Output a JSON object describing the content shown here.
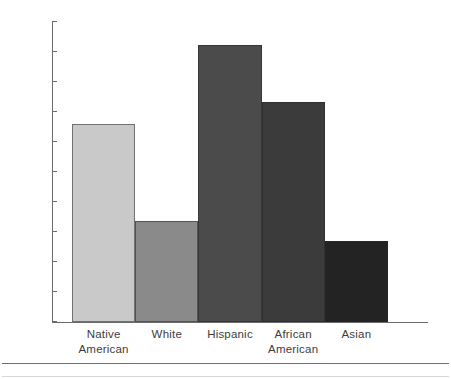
{
  "chart_data": {
    "type": "bar",
    "title": "",
    "subtitle": "",
    "xlabel": "",
    "ylabel": "",
    "categories": [
      "Native American",
      "White",
      "Hispanic",
      "African American",
      "Asian"
    ],
    "values": [
      33.0,
      16.8,
      46.2,
      36.7,
      13.5
    ],
    "ylim": [
      0,
      50
    ],
    "y_ticks": [
      0,
      5,
      10,
      15,
      20,
      25,
      30,
      35,
      40,
      45,
      50
    ],
    "y_tick_labels": [
      "0",
      "5",
      "10",
      "15",
      "20",
      "25",
      "30",
      "35",
      "40",
      "45",
      "50"
    ],
    "grid": false,
    "legend": false,
    "legend_position": "none",
    "annotations": [],
    "bar_colors": [
      "#c9c9c9",
      "#8a8a8a",
      "#4b4b4b",
      "#3b3b3b",
      "#232323"
    ],
    "bars": [
      {
        "category": "Native American",
        "label_lines": [
          "Native",
          "American"
        ],
        "value": 33.0,
        "color": "#c9c9c9"
      },
      {
        "category": "White",
        "label_lines": [
          "White"
        ],
        "value": 16.8,
        "color": "#8a8a8a"
      },
      {
        "category": "Hispanic",
        "label_lines": [
          "Hispanic"
        ],
        "value": 46.2,
        "color": "#4b4b4b"
      },
      {
        "category": "African American",
        "label_lines": [
          "African",
          "American"
        ],
        "value": 36.7,
        "color": "#3b3b3b"
      },
      {
        "category": "Asian",
        "label_lines": [
          "Asian"
        ],
        "value": 13.5,
        "color": "#232323"
      }
    ]
  },
  "axis": {
    "axis_color": "#6b6b6b",
    "tick_label_color": "#3d3d3d"
  },
  "separator": {
    "color": "#6f6f6f"
  }
}
